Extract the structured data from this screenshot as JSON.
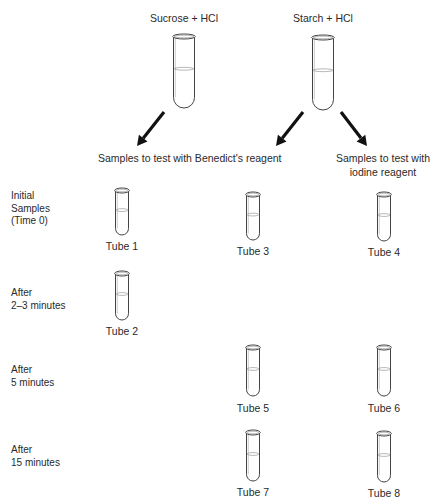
{
  "sources": [
    {
      "label": "Sucrose + HCl",
      "tube_x": 184,
      "tube_top": 34,
      "tube_bottom": 108
    },
    {
      "label": "Starch + HCl",
      "tube_x": 323,
      "tube_top": 35,
      "tube_bottom": 110
    }
  ],
  "arrows": [
    {
      "from": [
        164,
        112
      ],
      "to": [
        137,
        146
      ]
    },
    {
      "from": [
        303,
        112
      ],
      "to": [
        276,
        146
      ]
    },
    {
      "from": [
        341,
        112
      ],
      "to": [
        367,
        146
      ]
    }
  ],
  "headers": {
    "benedict": "Samples to test with Benedict's reagent",
    "iodine_line1": "Samples to test with",
    "iodine_line2": "iodine reagent"
  },
  "rows": [
    {
      "label": "Initial\nSamples\n(Time 0)",
      "y": 190
    },
    {
      "label": "After\n2–3 minutes",
      "y": 287
    },
    {
      "label": "After\n5 minutes",
      "y": 364
    },
    {
      "label": "After\n15 minutes",
      "y": 444
    }
  ],
  "tubes": [
    {
      "label": "Tube 1",
      "x": 122,
      "top": 188,
      "bottom": 235,
      "label_y": 240
    },
    {
      "label": "Tube 2",
      "x": 122,
      "top": 271,
      "bottom": 320,
      "label_y": 325
    },
    {
      "label": "Tube 3",
      "x": 253,
      "top": 192,
      "bottom": 240,
      "label_y": 245
    },
    {
      "label": "Tube 4",
      "x": 384,
      "top": 192,
      "bottom": 241,
      "label_y": 246
    },
    {
      "label": "Tube 5",
      "x": 253,
      "top": 345,
      "bottom": 396,
      "label_y": 402
    },
    {
      "label": "Tube 6",
      "x": 384,
      "top": 345,
      "bottom": 396,
      "label_y": 402
    },
    {
      "label": "Tube 7",
      "x": 253,
      "top": 430,
      "bottom": 481,
      "label_y": 486
    },
    {
      "label": "Tube 8",
      "x": 384,
      "top": 431,
      "bottom": 482,
      "label_y": 487
    }
  ]
}
